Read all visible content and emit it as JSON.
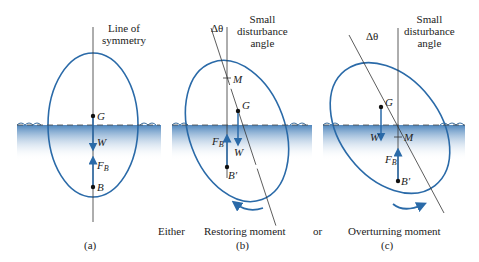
{
  "colors": {
    "ellipse_stroke": "#2a6aa8",
    "arrow": "#2a6aa8",
    "water_top": "#4f86bd",
    "water_bottom": "#ffffff",
    "axis_line": "#333333",
    "text": "#222222"
  },
  "panels": [
    {
      "id": "a",
      "caption": "(a)",
      "axis_label_line1": "Line of",
      "axis_label_line2": "symmetry",
      "points": {
        "G": "G",
        "W": "W",
        "FB": "F",
        "FB_sub": "B",
        "B": "B"
      }
    },
    {
      "id": "b",
      "caption": "(b)",
      "angle_label": "Δθ",
      "angle_desc_line1": "Small",
      "angle_desc_line2": "disturbance",
      "angle_desc_line3": "angle",
      "points": {
        "M": "M",
        "G": "G",
        "W": "W",
        "FB": "F",
        "FB_sub": "B",
        "B": "B'"
      },
      "moment_label": "Restoring moment"
    },
    {
      "id": "c",
      "caption": "(c)",
      "angle_label": "Δθ",
      "angle_desc_line1": "Small",
      "angle_desc_line2": "disturbance",
      "angle_desc_line3": "angle",
      "points": {
        "G": "G",
        "W": "W",
        "M": "M",
        "FB": "F",
        "FB_sub": "B",
        "B": "B'"
      },
      "moment_label": "Overturning moment"
    }
  ],
  "connectors": {
    "either": "Either",
    "or": "or"
  }
}
